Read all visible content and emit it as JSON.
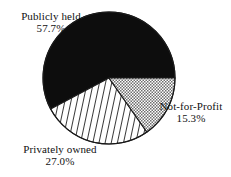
{
  "chart_data": {
    "type": "pie",
    "title": "",
    "categories": [
      "Publicly held",
      "Privately owned",
      "Not-for-Profit"
    ],
    "values": [
      57.7,
      27.0,
      15.3
    ],
    "value_labels": [
      "57.7%",
      "27.0%",
      "15.3%"
    ],
    "units": "percent",
    "legend": "none",
    "grid": false,
    "slices": [
      {
        "label": "Publicly held",
        "value": 57.7,
        "value_label": "57.7%",
        "fill": "solid-black",
        "color": "#0d0d0d",
        "start_angle_deg": 152,
        "end_angle_deg": 360
      },
      {
        "label": "Privately owned",
        "value": 27.0,
        "value_label": "27.0%",
        "fill": "diagonal-hatch",
        "color": "#1a1a1a",
        "start_angle_deg": 55,
        "end_angle_deg": 152
      },
      {
        "label": "Not-for-Profit",
        "value": 15.3,
        "value_label": "15.3%",
        "fill": "dotted-stipple",
        "color": "#555555",
        "start_angle_deg": 0,
        "end_angle_deg": 55
      }
    ],
    "geometry": {
      "center_x": 109,
      "center_y": 78,
      "radius": 66
    },
    "colors": {
      "background": "#ffffff",
      "outline": "#1a1a1a",
      "text": "#111111"
    }
  },
  "labels": {
    "publicly_held": {
      "name": "Publicly held",
      "value": "57.7%"
    },
    "privately_owned": {
      "name": "Privately owned",
      "value": "27.0%"
    },
    "not_for_profit": {
      "name": "Not-for-Profit",
      "value": "15.3%"
    }
  }
}
